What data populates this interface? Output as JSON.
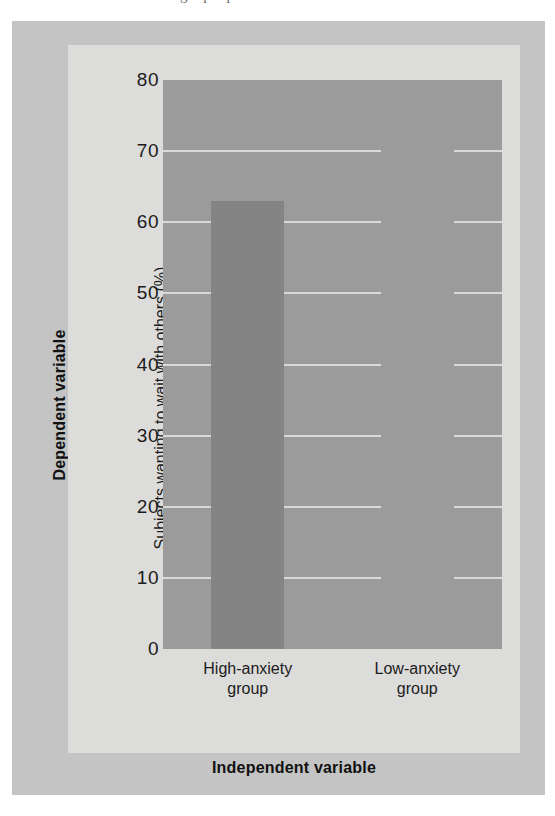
{
  "figure": {
    "top_cut_text": "g p p",
    "dependent_variable_label": "Dependent variable",
    "independent_variable_label": "Independent variable"
  },
  "chart_data": {
    "type": "bar",
    "title": "",
    "subtitle": "",
    "xlabel": "Independent variable",
    "ylabel": "Subjects wanting to wait with others (%)",
    "categories": [
      "High-anxiety group",
      "Low-anxiety group"
    ],
    "category_lines": [
      [
        "High-anxiety",
        "group"
      ],
      [
        "Low-anxiety",
        "group"
      ]
    ],
    "values": [
      63,
      0
    ],
    "ylim": [
      0,
      80
    ],
    "yticks": [
      80,
      70,
      60,
      50,
      40,
      30,
      20,
      10,
      0
    ],
    "ytick_labels": [
      "80",
      "70",
      "60",
      "50",
      "40",
      "30",
      "20",
      "10",
      "0"
    ],
    "grid": true,
    "grid_orientation": "horizontal",
    "legend": false,
    "legend_position": "none",
    "bar_width_fraction": 0.43,
    "annotations": [
      "Left axis group label: Dependent variable",
      "Bottom axis group label: Independent variable"
    ]
  },
  "colors": {
    "page_background": "#ffffff",
    "outer_frame": "#c3c4c3",
    "inner_panel": "#dcdcda",
    "plot_area": "#9b9b9b",
    "bar_fill": "#848484",
    "gridline": "#d9d9d7",
    "tick_text": "#1b1b1b",
    "bold_label_text": "#111111"
  }
}
